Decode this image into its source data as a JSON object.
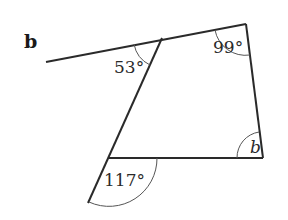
{
  "part_label": "b",
  "angles": {
    "top_left": "53°",
    "top_right": "99°",
    "bottom_left_exterior": "117°",
    "bottom_right": "b"
  },
  "colors": {
    "line": "#2a2a2a",
    "arc": "#555555",
    "background": "#ffffff"
  }
}
